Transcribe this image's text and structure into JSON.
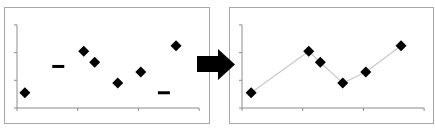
{
  "diagram": {
    "arrow_color": "#000000",
    "frame_border_color": "#a8a8a8",
    "axis_color": "#8c8c8c",
    "line_color": "#c8c8c8",
    "marker_color": "#000000"
  },
  "chart_data": [
    {
      "type": "scatter",
      "title": "",
      "xlabel": "",
      "ylabel": "",
      "xlim": [
        0,
        3
      ],
      "ylim": [
        0,
        3
      ],
      "x_ticks": [
        0,
        1,
        2,
        3
      ],
      "y_ticks": [
        0,
        1,
        2,
        3
      ],
      "tick_labels_visible": false,
      "grid": false,
      "series": [
        {
          "name": "points",
          "marker": "diamond",
          "x": [
            0.13,
            1.1,
            1.28,
            1.66,
            2.04,
            2.62
          ],
          "y": [
            0.55,
            2.05,
            1.65,
            0.9,
            1.3,
            2.25
          ]
        },
        {
          "name": "missing/invalid",
          "marker": "dash",
          "x": [
            0.68,
            2.42
          ],
          "y": [
            1.5,
            0.55
          ]
        }
      ]
    },
    {
      "type": "line",
      "title": "",
      "xlabel": "",
      "ylabel": "",
      "xlim": [
        0,
        3
      ],
      "ylim": [
        0,
        3
      ],
      "x_ticks": [
        0,
        1,
        2,
        3
      ],
      "y_ticks": [
        0,
        1,
        2,
        3
      ],
      "tick_labels_visible": false,
      "grid": false,
      "series": [
        {
          "name": "connected points",
          "marker": "diamond",
          "x": [
            0.15,
            1.1,
            1.29,
            1.66,
            2.04,
            2.62
          ],
          "y": [
            0.55,
            2.05,
            1.65,
            0.9,
            1.3,
            2.25
          ]
        }
      ]
    }
  ]
}
